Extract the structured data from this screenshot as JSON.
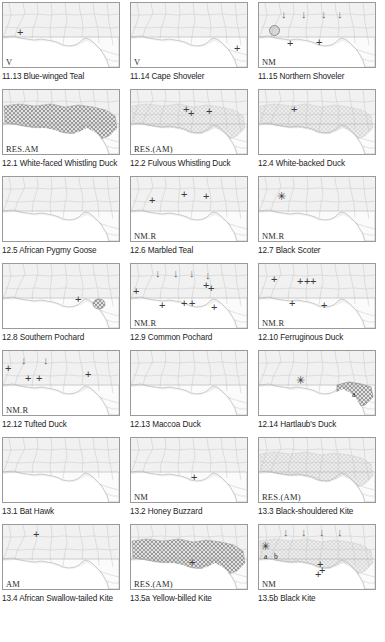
{
  "figure": {
    "columns": 3,
    "rows": 7,
    "panel_count": 21,
    "colors": {
      "panel_background": "#f1f1f1",
      "panel_border": "#9a9a9a",
      "country_outline": "#b9b9b9",
      "sea": "#ffffff",
      "range_dark": "#9a9a9a",
      "range_light": "#d4d4d4",
      "marker": "#3a3a3a",
      "arrow": "#6a6a6a",
      "caption_text": "#1d1d1d"
    },
    "legend_symbols": {
      "cross": "+",
      "star": "✳",
      "arrow": "↓",
      "circle": "circle-marker"
    }
  },
  "panels": [
    {
      "id": "11.13",
      "caption": "11.13 Blue-winged Teal",
      "code": "V",
      "shading": "none",
      "markers": [
        {
          "type": "cross",
          "x": 14,
          "y": 24
        }
      ]
    },
    {
      "id": "11.14",
      "caption": "11.14 Cape Shoveler",
      "code": "V",
      "shading": "none",
      "markers": [
        {
          "type": "cross",
          "x": 103,
          "y": 40
        }
      ]
    },
    {
      "id": "11.15",
      "caption": "11.15 Northern Shoveler",
      "code": "NM",
      "shading": "none",
      "markers": [
        {
          "type": "arrow",
          "x": 22,
          "y": 6
        },
        {
          "type": "arrow",
          "x": 42,
          "y": 6
        },
        {
          "type": "arrow",
          "x": 62,
          "y": 6
        },
        {
          "type": "arrow",
          "x": 78,
          "y": 6
        },
        {
          "type": "circle",
          "x": 10,
          "y": 22
        },
        {
          "type": "cross",
          "x": 28,
          "y": 35
        },
        {
          "type": "cross",
          "x": 57,
          "y": 34
        }
      ]
    },
    {
      "id": "12.1",
      "caption": "12.1 White-faced Whistling Duck",
      "code": "RES.AM",
      "shading": "dark",
      "markers": []
    },
    {
      "id": "12.2",
      "caption": "12.2 Fulvous Whistling Duck",
      "code": "RES.(AM)",
      "shading": "light",
      "markers": [
        {
          "type": "cross",
          "x": 52,
          "y": 14
        },
        {
          "type": "cross",
          "x": 57,
          "y": 18
        },
        {
          "type": "cross",
          "x": 75,
          "y": 16
        }
      ]
    },
    {
      "id": "12.4",
      "caption": "12.4 White-backed Duck",
      "code": "",
      "shading": "light",
      "markers": [
        {
          "type": "cross",
          "x": 32,
          "y": 14
        }
      ]
    },
    {
      "id": "12.5",
      "caption": "12.5 African Pygmy Goose",
      "code": "",
      "shading": "none",
      "markers": []
    },
    {
      "id": "12.6",
      "caption": "12.6 Marbled Teal",
      "code": "NM.R",
      "shading": "none",
      "markers": [
        {
          "type": "cross",
          "x": 18,
          "y": 18
        },
        {
          "type": "cross",
          "x": 50,
          "y": 12
        },
        {
          "type": "cross",
          "x": 72,
          "y": 14
        }
      ]
    },
    {
      "id": "12.7",
      "caption": "12.7 Black Scoter",
      "code": "NM.R",
      "shading": "none",
      "markers": [
        {
          "type": "star",
          "x": 18,
          "y": 14
        }
      ]
    },
    {
      "id": "12.8",
      "caption": "12.8 Southern Pochard",
      "code": "",
      "shading": "none",
      "markers": [
        {
          "type": "cross",
          "x": 72,
          "y": 30
        },
        {
          "type": "patch",
          "x": 95,
          "y": 38
        }
      ]
    },
    {
      "id": "12.9",
      "caption": "12.9 Common Pochard",
      "code": "NM.R",
      "shading": "none",
      "markers": [
        {
          "type": "arrow",
          "x": 24,
          "y": 4
        },
        {
          "type": "arrow",
          "x": 42,
          "y": 4
        },
        {
          "type": "arrow",
          "x": 58,
          "y": 4
        },
        {
          "type": "arrow",
          "x": 74,
          "y": 6
        },
        {
          "type": "cross",
          "x": 2,
          "y": 22
        },
        {
          "type": "cross",
          "x": 72,
          "y": 16
        },
        {
          "type": "cross",
          "x": 77,
          "y": 19
        },
        {
          "type": "cross",
          "x": 28,
          "y": 36
        },
        {
          "type": "cross",
          "x": 50,
          "y": 34
        },
        {
          "type": "cross",
          "x": 58,
          "y": 34
        },
        {
          "type": "cross",
          "x": 80,
          "y": 38
        }
      ]
    },
    {
      "id": "12.10",
      "caption": "12.10 Ferruginous Duck",
      "code": "NM.R",
      "shading": "none",
      "markers": [
        {
          "type": "cross",
          "x": 12,
          "y": 10
        },
        {
          "type": "cross",
          "x": 38,
          "y": 12
        },
        {
          "type": "cross",
          "x": 45,
          "y": 12
        },
        {
          "type": "cross",
          "x": 51,
          "y": 12
        },
        {
          "type": "cross",
          "x": 30,
          "y": 34
        },
        {
          "type": "cross",
          "x": 62,
          "y": 36
        }
      ]
    },
    {
      "id": "12.12",
      "caption": "12.12 Tufted Duck",
      "code": "NM.R",
      "shading": "none",
      "markers": [
        {
          "type": "arrow",
          "x": 18,
          "y": 4
        },
        {
          "type": "arrow",
          "x": 40,
          "y": 4
        },
        {
          "type": "cross",
          "x": 2,
          "y": 12
        },
        {
          "type": "cross",
          "x": 22,
          "y": 22
        },
        {
          "type": "cross",
          "x": 33,
          "y": 22
        },
        {
          "type": "cross",
          "x": 82,
          "y": 18
        }
      ]
    },
    {
      "id": "12.13",
      "caption": "12.13 Maccoa Duck",
      "code": "",
      "shading": "none",
      "markers": []
    },
    {
      "id": "12.14",
      "caption": "12.14 Hartlaub's Duck",
      "code": "",
      "shading": "split",
      "markers": [
        {
          "type": "star",
          "x": 37,
          "y": 24
        },
        {
          "type": "lab",
          "x": 93,
          "y": 40,
          "text": "a"
        }
      ]
    },
    {
      "id": "13.1",
      "caption": "13.1 Bat Hawk",
      "code": "",
      "shading": "none",
      "markers": []
    },
    {
      "id": "13.2",
      "caption": "13.2 Honey Buzzard",
      "code": "NM",
      "shading": "none",
      "markers": [
        {
          "type": "cross",
          "x": 60,
          "y": 34
        }
      ]
    },
    {
      "id": "13.3",
      "caption": "13.3 Black-shouldered Kite",
      "code": "RES.(AM)",
      "shading": "light",
      "markers": []
    },
    {
      "id": "13.4",
      "caption": "13.4 African Swallow-tailed Kite",
      "code": "AM",
      "shading": "none",
      "markers": [
        {
          "type": "cross",
          "x": 30,
          "y": 4
        }
      ]
    },
    {
      "id": "13.5a",
      "caption": "13.5a Yellow-billed Kite",
      "code": "RES.(AM)",
      "shading": "dark",
      "markers": [
        {
          "type": "cross",
          "x": 58,
          "y": 32
        }
      ]
    },
    {
      "id": "13.5b",
      "caption": "13.5b Black Kite",
      "code": "NM",
      "shading": "light",
      "markers": [
        {
          "type": "arrow",
          "x": 24,
          "y": 2
        },
        {
          "type": "arrow",
          "x": 42,
          "y": 2
        },
        {
          "type": "arrow",
          "x": 60,
          "y": 2
        },
        {
          "type": "arrow",
          "x": 78,
          "y": 2
        },
        {
          "type": "star",
          "x": 2,
          "y": 16
        },
        {
          "type": "lab",
          "x": 5,
          "y": 28,
          "text": "a"
        },
        {
          "type": "lab",
          "x": 15,
          "y": 28,
          "text": "b"
        },
        {
          "type": "cross",
          "x": 58,
          "y": 34
        },
        {
          "type": "cross",
          "x": 60,
          "y": 40
        },
        {
          "type": "cross",
          "x": 56,
          "y": 44
        }
      ]
    }
  ]
}
